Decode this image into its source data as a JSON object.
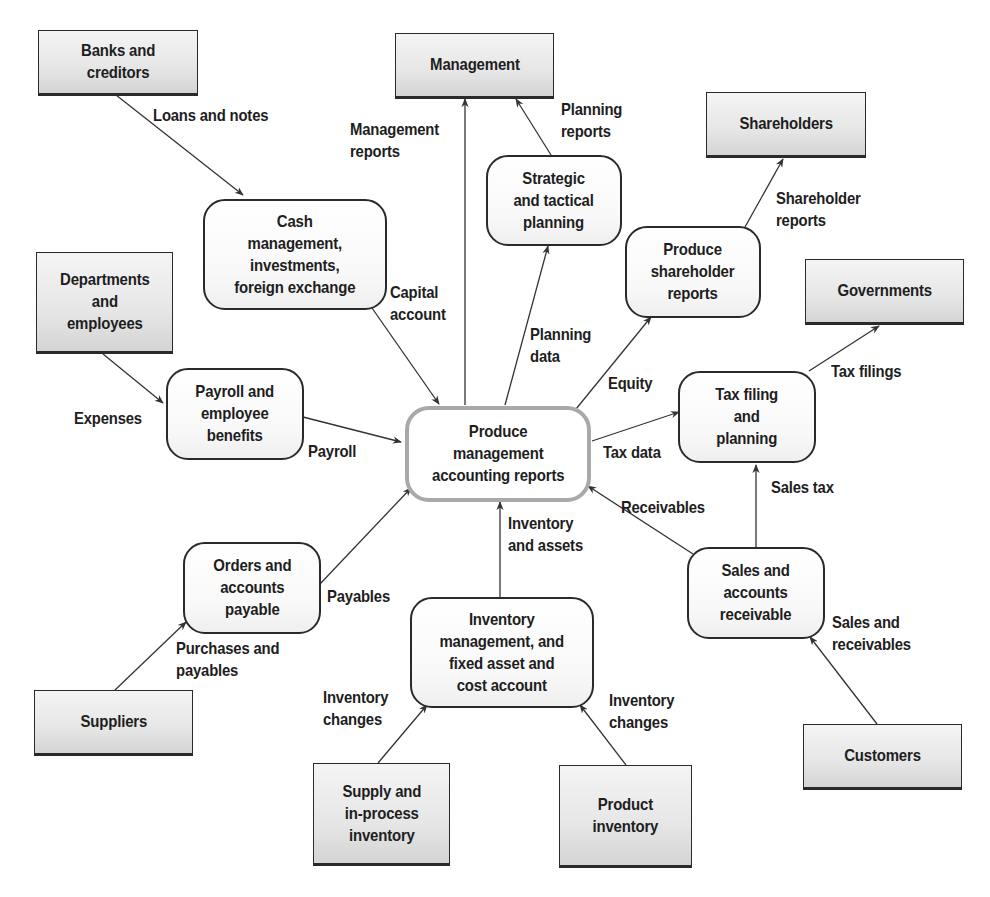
{
  "diagram": {
    "type": "data-flow",
    "central_process": "Produce\nmanagement\naccounting reports",
    "entities": {
      "banks": "Banks and\ncreditors",
      "management": "Management",
      "shareholders": "Shareholders",
      "departments": "Departments\nand\nemployees",
      "governments": "Governments",
      "suppliers": "Suppliers",
      "supply_inventory": "Supply and\nin-process\ninventory",
      "product_inventory": "Product\ninventory",
      "customers": "Customers"
    },
    "processes": {
      "cash": "Cash\nmanagement,\ninvestments,\nforeign exchange",
      "strategic": "Strategic\nand tactical\nplanning",
      "shareholder_reports": "Produce\nshareholder\nreports",
      "payroll": "Payroll and\nemployee\nbenefits",
      "tax": "Tax filing\nand\nplanning",
      "orders": "Orders and\naccounts\npayable",
      "inventory": "Inventory\nmanagement, and\nfixed asset and\ncost account",
      "sales": "Sales and\naccounts\nreceivable"
    },
    "flows": {
      "loans": "Loans and notes",
      "management_reports": "Management\nreports",
      "planning_reports": "Planning\nreports",
      "shareholder_reports": "Shareholder\nreports",
      "capital_account": "Capital\naccount",
      "planning_data": "Planning\ndata",
      "equity": "Equity",
      "tax_filings": "Tax filings",
      "expenses": "Expenses",
      "payroll": "Payroll",
      "tax_data": "Tax data",
      "receivables": "Receivables",
      "sales_tax": "Sales tax",
      "inventory_assets": "Inventory\nand assets",
      "payables": "Payables",
      "purchases_payables": "Purchases and\npayables",
      "sales_receivables": "Sales and\nreceivables",
      "inventory_changes_left": "Inventory\nchanges",
      "inventory_changes_right": "Inventory\nchanges"
    },
    "colors": {
      "line": "#333333",
      "central_border": "#a9a9a9",
      "entity_fill": "#e6e6e6",
      "text": "#1e1e1e"
    }
  }
}
